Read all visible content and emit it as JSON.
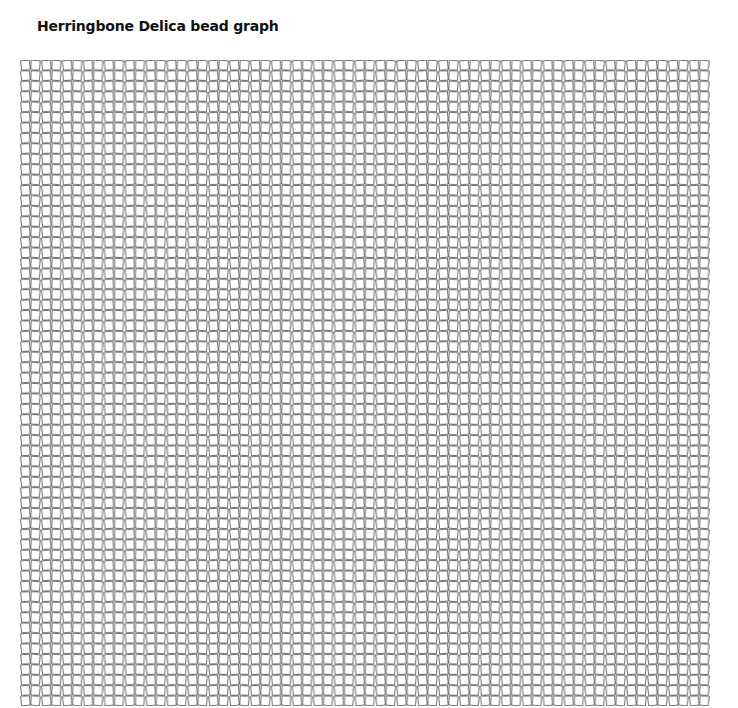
{
  "page": {
    "title": "Herringbone Delica bead graph"
  },
  "graph": {
    "type": "herringbone-bead-grid",
    "bead": "Delica",
    "columns": 66,
    "rows": 62,
    "line_color": "#333333",
    "background": "#ffffff"
  }
}
